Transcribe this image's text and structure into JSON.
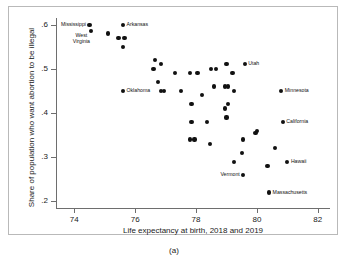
{
  "figure": {
    "caption": "(a)"
  },
  "chart_data": {
    "type": "scatter",
    "title": "",
    "xlabel": "Life expectancy at birth, 2018 and 2019",
    "ylabel": "Share of population who want abortion to be illegal",
    "xlim": [
      73.4,
      82.4
    ],
    "ylim": [
      0.185,
      0.615
    ],
    "xticks": [
      74,
      76,
      78,
      80,
      82
    ],
    "xticklabels": [
      "74",
      "76",
      "78",
      "80",
      "82"
    ],
    "yticks": [
      0.2,
      0.3,
      0.4,
      0.5,
      0.6
    ],
    "yticklabels": [
      ".2",
      ".3",
      ".4",
      ".5",
      ".6"
    ],
    "grid": false,
    "legend": null,
    "marker": "filled-circle",
    "marker_color": "#111111",
    "points": [
      {
        "x": 74.5,
        "y": 0.6,
        "label": "Mississippi",
        "label_pos": "left"
      },
      {
        "x": 74.55,
        "y": 0.585,
        "label": "West\nVirginia",
        "label_pos": "below-left"
      },
      {
        "x": 75.1,
        "y": 0.58,
        "label": ""
      },
      {
        "x": 75.45,
        "y": 0.57,
        "label": ""
      },
      {
        "x": 75.65,
        "y": 0.57,
        "label": ""
      },
      {
        "x": 75.6,
        "y": 0.6,
        "label": "Arkansas",
        "label_pos": "right"
      },
      {
        "x": 75.6,
        "y": 0.55,
        "label": ""
      },
      {
        "x": 76.65,
        "y": 0.52,
        "label": ""
      },
      {
        "x": 76.6,
        "y": 0.5,
        "label": ""
      },
      {
        "x": 76.85,
        "y": 0.51,
        "label": ""
      },
      {
        "x": 76.75,
        "y": 0.47,
        "label": ""
      },
      {
        "x": 76.85,
        "y": 0.45,
        "label": ""
      },
      {
        "x": 76.95,
        "y": 0.45,
        "label": ""
      },
      {
        "x": 75.6,
        "y": 0.45,
        "label": "Oklahoma",
        "label_pos": "right"
      },
      {
        "x": 77.3,
        "y": 0.49,
        "label": ""
      },
      {
        "x": 77.5,
        "y": 0.45,
        "label": ""
      },
      {
        "x": 77.8,
        "y": 0.49,
        "label": ""
      },
      {
        "x": 78.05,
        "y": 0.49,
        "label": ""
      },
      {
        "x": 77.85,
        "y": 0.42,
        "label": ""
      },
      {
        "x": 78.2,
        "y": 0.44,
        "label": ""
      },
      {
        "x": 77.85,
        "y": 0.38,
        "label": ""
      },
      {
        "x": 78.35,
        "y": 0.38,
        "label": ""
      },
      {
        "x": 77.8,
        "y": 0.34,
        "label": ""
      },
      {
        "x": 77.95,
        "y": 0.34,
        "label": ""
      },
      {
        "x": 78.45,
        "y": 0.33,
        "label": ""
      },
      {
        "x": 78.5,
        "y": 0.5,
        "label": ""
      },
      {
        "x": 78.65,
        "y": 0.5,
        "label": ""
      },
      {
        "x": 79.0,
        "y": 0.51,
        "label": ""
      },
      {
        "x": 78.6,
        "y": 0.46,
        "label": ""
      },
      {
        "x": 78.95,
        "y": 0.46,
        "label": ""
      },
      {
        "x": 79.05,
        "y": 0.46,
        "label": ""
      },
      {
        "x": 79.2,
        "y": 0.49,
        "label": ""
      },
      {
        "x": 79.25,
        "y": 0.45,
        "label": ""
      },
      {
        "x": 79.05,
        "y": 0.42,
        "label": ""
      },
      {
        "x": 78.95,
        "y": 0.41,
        "label": ""
      },
      {
        "x": 79.0,
        "y": 0.39,
        "label": ""
      },
      {
        "x": 79.6,
        "y": 0.51,
        "label": "Utah",
        "label_pos": "right"
      },
      {
        "x": 79.55,
        "y": 0.34,
        "label": ""
      },
      {
        "x": 79.95,
        "y": 0.355,
        "label": ""
      },
      {
        "x": 80.0,
        "y": 0.36,
        "label": ""
      },
      {
        "x": 79.5,
        "y": 0.31,
        "label": ""
      },
      {
        "x": 79.25,
        "y": 0.29,
        "label": ""
      },
      {
        "x": 79.55,
        "y": 0.26,
        "label": "Vermont",
        "label_pos": "left"
      },
      {
        "x": 80.8,
        "y": 0.45,
        "label": "Minnesota",
        "label_pos": "right"
      },
      {
        "x": 80.85,
        "y": 0.38,
        "label": "California",
        "label_pos": "right"
      },
      {
        "x": 80.6,
        "y": 0.32,
        "label": ""
      },
      {
        "x": 81.0,
        "y": 0.29,
        "label": "Hawaii",
        "label_pos": "right"
      },
      {
        "x": 80.35,
        "y": 0.28,
        "label": ""
      },
      {
        "x": 80.4,
        "y": 0.22,
        "label": "Massachusetts",
        "label_pos": "right"
      }
    ]
  }
}
